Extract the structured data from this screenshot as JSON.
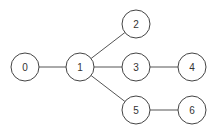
{
  "diagram": {
    "type": "tree",
    "node_radius": 14,
    "nodes": [
      {
        "id": "0",
        "label": "0",
        "x": 25,
        "y": 67
      },
      {
        "id": "1",
        "label": "1",
        "x": 80,
        "y": 67
      },
      {
        "id": "2",
        "label": "2",
        "x": 136,
        "y": 24
      },
      {
        "id": "3",
        "label": "3",
        "x": 136,
        "y": 67
      },
      {
        "id": "4",
        "label": "4",
        "x": 192,
        "y": 67
      },
      {
        "id": "5",
        "label": "5",
        "x": 136,
        "y": 110
      },
      {
        "id": "6",
        "label": "6",
        "x": 192,
        "y": 110
      }
    ],
    "edges": [
      {
        "from": "0",
        "to": "1"
      },
      {
        "from": "1",
        "to": "2"
      },
      {
        "from": "1",
        "to": "3"
      },
      {
        "from": "1",
        "to": "5"
      },
      {
        "from": "3",
        "to": "4"
      },
      {
        "from": "5",
        "to": "6"
      }
    ],
    "colors": {
      "edge": "#555555",
      "node_stroke": "#444444",
      "node_fill": "#ffffff",
      "label": "#333333"
    }
  }
}
